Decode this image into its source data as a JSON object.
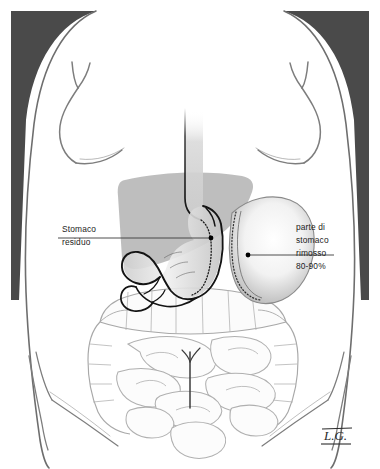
{
  "figure": {
    "language": "it",
    "signature": "L.G."
  },
  "annotations": {
    "left": {
      "name": "stomaco-residuo",
      "lines": [
        "Stomaco",
        "residuo"
      ],
      "line1": "Stomaco",
      "line2": "residuo",
      "marker_x": 211,
      "marker_y": 238
    },
    "right": {
      "name": "parte-di-stomaco-rimosso",
      "lines": [
        "parte di",
        "stomaco",
        "rimosso",
        "80-90%"
      ],
      "line1": "parte di",
      "line2": "stomaco",
      "line3": "rimosso",
      "line4": "80-90%",
      "percent": "80-90%",
      "marker_x": 248,
      "marker_y": 255
    }
  },
  "anatomy": {
    "esophagus": "esophagus",
    "sleeve_stomach": "residual gastric sleeve",
    "resected_stomach": "resected gastric fundus and body",
    "liver": "liver",
    "duodenum": "duodenum",
    "colon": "large intestine",
    "small_bowel": "small intestine",
    "staple_line": "dotted staple line",
    "torso": "female torso outline"
  },
  "colors": {
    "background": "#ffffff",
    "corner_wedge": "#4a4a4a",
    "liver_gray": "#b9b9b9",
    "organ_outline": "#9b9b9b",
    "stomach_outline": "#1a1a1a",
    "body_outline": "#6e6e6e",
    "text": "#1c1c1c",
    "marker_dot": "#000000",
    "leader_line": "#3a3a3a",
    "resected_fill_center": "#ffffff",
    "resected_fill_edge": "#bdbdbd"
  }
}
